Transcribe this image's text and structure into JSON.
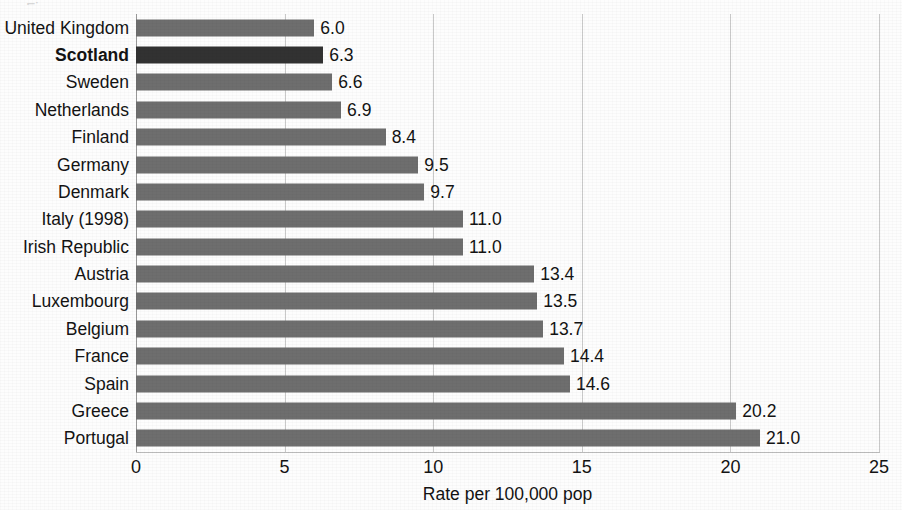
{
  "chart_data": {
    "type": "bar",
    "orientation": "horizontal",
    "title": "",
    "xlabel": "Rate per 100,000 pop",
    "ylabel": "",
    "xlim": [
      0,
      25
    ],
    "xticks": [
      0,
      5,
      10,
      15,
      20,
      25
    ],
    "xtick_labels": [
      "0",
      "5",
      "10",
      "15",
      "20",
      "25"
    ],
    "grid": true,
    "grid_axis": "x",
    "legend": "none",
    "highlight_category": "Scotland",
    "categories": [
      "United Kingdom",
      "Scotland",
      "Sweden",
      "Netherlands",
      "Finland",
      "Germany",
      "Denmark",
      "Italy (1998)",
      "Irish Republic",
      "Austria",
      "Luxembourg",
      "Belgium",
      "France",
      "Spain",
      "Greece",
      "Portugal"
    ],
    "values": [
      6.0,
      6.3,
      6.6,
      6.9,
      8.4,
      9.5,
      9.7,
      11.0,
      11.0,
      13.4,
      13.5,
      13.7,
      14.4,
      14.6,
      20.2,
      21.0
    ],
    "value_labels": [
      "6.0",
      "6.3",
      "6.6",
      "6.9",
      "8.4",
      "9.5",
      "9.7",
      "11.0",
      "11.0",
      "13.4",
      "13.5",
      "13.7",
      "14.4",
      "14.6",
      "20.2",
      "21.0"
    ],
    "colors": {
      "bar": "#6e6e6e",
      "bar_highlight": "#323232",
      "gridline": "#c9c9c9",
      "axis": "#9a9a9a",
      "text": "#131313",
      "background": "#fdfdfd"
    }
  },
  "clipped_title_fragment": "Figure"
}
